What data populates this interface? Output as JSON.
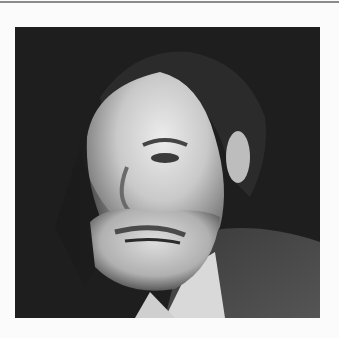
{
  "page": {
    "background": "#fbfbfb",
    "rule_color": "#8a8a8a"
  },
  "photo": {
    "subject": "black-and-white portrait of an older bearded man in a suit",
    "palette": {
      "background": "#1f1f1f",
      "hair": "#2a2a2a",
      "skin_light": "#e6e6e6",
      "skin_mid": "#b5b5b5",
      "beard": "#cfcfcf",
      "collar": "#d9d9d9",
      "jacket": "#4a4a4a"
    }
  }
}
